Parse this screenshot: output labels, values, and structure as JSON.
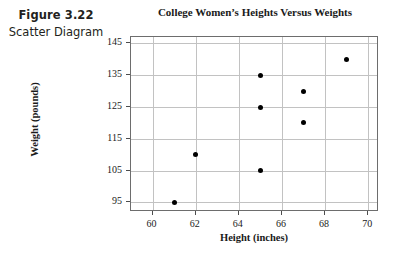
{
  "figure": {
    "number": "Figure 3.22",
    "subtitle": "Scatter Diagram"
  },
  "chart_data": {
    "type": "scatter",
    "title": "College Women’s Heights Versus Weights",
    "xlabel": "Height (inches)",
    "ylabel": "Weight (pounds)",
    "xlim": [
      59,
      70.5
    ],
    "ylim": [
      92,
      147
    ],
    "xticks": [
      60,
      62,
      64,
      66,
      68,
      70
    ],
    "yticks": [
      95,
      105,
      115,
      125,
      135,
      145
    ],
    "xticklabels": [
      "60",
      "62",
      "64",
      "66",
      "68",
      "70"
    ],
    "yticklabels": [
      "95",
      "105",
      "115",
      "125",
      "135",
      "145"
    ],
    "grid": true,
    "legend": null,
    "marker": "filled-circle",
    "marker_color": "#000000",
    "points": [
      {
        "x": 61,
        "y": 95
      },
      {
        "x": 62,
        "y": 110
      },
      {
        "x": 65,
        "y": 105
      },
      {
        "x": 65,
        "y": 125
      },
      {
        "x": 65,
        "y": 135
      },
      {
        "x": 67,
        "y": 120
      },
      {
        "x": 67,
        "y": 130
      },
      {
        "x": 69,
        "y": 140
      }
    ]
  }
}
